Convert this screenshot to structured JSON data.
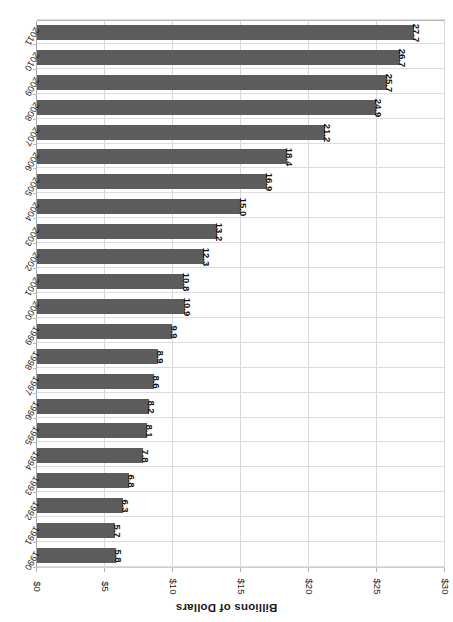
{
  "chart_data": {
    "type": "bar",
    "orientation": "horizontal",
    "title": "",
    "xlabel": "Billions of Dollars",
    "ylabel": "",
    "axis_title": "Billions of Dollars",
    "categories": [
      "1990",
      "1991",
      "1992",
      "1993",
      "1994",
      "1995",
      "1996",
      "1997",
      "1998",
      "1999",
      "2000",
      "2001",
      "2002",
      "2003",
      "2004",
      "2005",
      "2006",
      "2007",
      "2008",
      "2009",
      "2010",
      "2011"
    ],
    "values": [
      5.8,
      5.7,
      6.3,
      6.8,
      7.8,
      8.1,
      8.2,
      8.6,
      8.9,
      9.9,
      10.9,
      10.8,
      12.3,
      13.2,
      15.0,
      16.9,
      18.4,
      21.2,
      24.9,
      25.7,
      26.7,
      27.7
    ],
    "data_labels": [
      "5.8",
      "5.7",
      "6.3",
      "6.8",
      "7.8",
      "8.1",
      "8.2",
      "8.6",
      "8.9",
      "9.9",
      "10.9",
      "10.8",
      "12.3",
      "13.2",
      "15.0",
      "16.9",
      "18.4",
      "21.2",
      "24.9",
      "25.7",
      "26.7",
      "27.7"
    ],
    "tick_labels": [
      "$0",
      "$5",
      "$10",
      "$15",
      "$20",
      "$25",
      "$30"
    ],
    "tick_values": [
      0,
      5,
      10,
      15,
      20,
      25,
      30
    ],
    "xlim": [
      0,
      30
    ],
    "grid": true,
    "legend": "none",
    "bar_color": "#5c5c5c",
    "gridline_color": "#d8d8d8",
    "background_color": "#ffffff",
    "rotation_degrees": 180
  }
}
